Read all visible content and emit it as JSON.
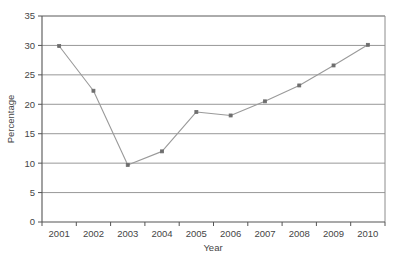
{
  "chart_data": {
    "type": "line",
    "title": "",
    "subtitle": "",
    "xlabel": "Year",
    "ylabel": "Percentage",
    "categories": [
      "2001",
      "2002",
      "2003",
      "2004",
      "2005",
      "2006",
      "2007",
      "2008",
      "2009",
      "2010"
    ],
    "values": [
      29.9,
      22.3,
      9.7,
      12.0,
      18.7,
      18.1,
      20.5,
      23.2,
      26.6,
      30.1
    ],
    "series": [
      {
        "name": "Percentage",
        "values": [
          29.9,
          22.3,
          9.7,
          12.0,
          18.7,
          18.1,
          20.5,
          23.2,
          26.6,
          30.1
        ]
      }
    ],
    "ylim": [
      0,
      35
    ],
    "yticks": [
      "0",
      "5",
      "10",
      "15",
      "20",
      "25",
      "30",
      "35"
    ],
    "ytick_values": [
      0,
      5,
      10,
      15,
      20,
      25,
      30,
      35
    ],
    "xticks": [
      "2001",
      "2002",
      "2003",
      "2004",
      "2005",
      "2006",
      "2007",
      "2008",
      "2009",
      "2010"
    ],
    "grid": "horizontal",
    "legend": "none",
    "marker": "square",
    "line_color": "#9a9a9a",
    "marker_color": "#6e6e6e",
    "grid_color": "#8c8c8c",
    "axis_color": "#555555",
    "text_color": "#454545",
    "background_color": "#ffffff"
  }
}
